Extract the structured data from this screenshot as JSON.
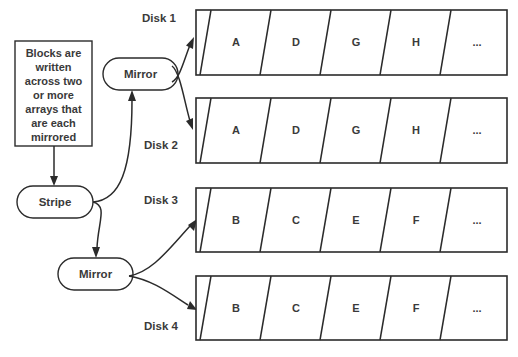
{
  "diagram": {
    "title_note": {
      "lines": [
        "Blocks are",
        "written",
        "across two",
        "or more",
        "arrays that",
        "are each",
        "mirrored"
      ]
    },
    "nodes": {
      "stripe_label": "Stripe",
      "mirror_top_label": "Mirror",
      "mirror_bottom_label": "Mirror"
    },
    "disks": [
      {
        "label": "Disk 1",
        "blocks": [
          "A",
          "D",
          "G",
          "H",
          "..."
        ]
      },
      {
        "label": "Disk 2",
        "blocks": [
          "A",
          "D",
          "G",
          "H",
          "..."
        ]
      },
      {
        "label": "Disk 3",
        "blocks": [
          "B",
          "C",
          "E",
          "F",
          "..."
        ]
      },
      {
        "label": "Disk 4",
        "blocks": [
          "B",
          "C",
          "E",
          "F",
          "..."
        ]
      }
    ],
    "colors": {
      "stroke": "#2b2b2b",
      "text": "#3a3a3a",
      "background": "#ffffff"
    }
  }
}
